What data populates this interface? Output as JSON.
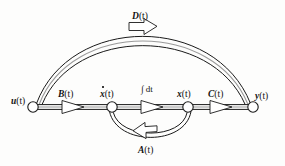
{
  "diagram": {
    "type": "signal-flow-graph",
    "title_visible": false,
    "nodes": [
      {
        "id": "u",
        "label_main": "u",
        "label_arg": "(t)",
        "x": 33,
        "y": 107,
        "r": 5.2,
        "label_x": 11,
        "label_y": 97,
        "dot": false
      },
      {
        "id": "xdot",
        "label_main": "x",
        "label_arg": "(t)",
        "x": 112,
        "y": 107,
        "r": 5.2,
        "label_x": 100,
        "label_y": 90,
        "dot": true
      },
      {
        "id": "x",
        "label_main": "x",
        "label_arg": "(t)",
        "x": 188,
        "y": 107,
        "r": 5.2,
        "label_x": 177,
        "label_y": 90,
        "dot": false
      },
      {
        "id": "y",
        "label_main": "y",
        "label_arg": "(t)",
        "x": 253,
        "y": 107,
        "r": 5.2,
        "label_x": 255,
        "label_y": 92,
        "dot": false
      }
    ],
    "edges": [
      {
        "id": "B",
        "label_main": "B",
        "label_arg": "(t)",
        "from": "u",
        "to": "xdot",
        "shape": "straight",
        "label_x": 58,
        "label_y": 90
      },
      {
        "id": "I",
        "label_main": "",
        "label_arg": "",
        "from": "xdot",
        "to": "x",
        "shape": "straight",
        "label_x": 141,
        "label_y": 85,
        "operator": "∫ dt"
      },
      {
        "id": "C",
        "label_main": "C",
        "label_arg": "(t)",
        "from": "x",
        "to": "y",
        "shape": "straight",
        "label_x": 208,
        "label_y": 90
      },
      {
        "id": "D",
        "label_main": "D",
        "label_arg": "(t)",
        "from": "u",
        "to": "y",
        "shape": "arc-top",
        "label_x": 132,
        "label_y": 12
      },
      {
        "id": "A",
        "label_main": "A",
        "label_arg": "(t)",
        "from": "x",
        "to": "xdot",
        "shape": "arc-bottom",
        "label_x": 138,
        "label_y": 146
      }
    ],
    "colors": {
      "stroke": "#1a1a1a",
      "edge_inner": "#9a9a9a",
      "node_fill": "#ffffff",
      "arrow_fill": "#ffffff",
      "background": "#fdfdfc"
    }
  },
  "caption": {
    "text": ""
  }
}
